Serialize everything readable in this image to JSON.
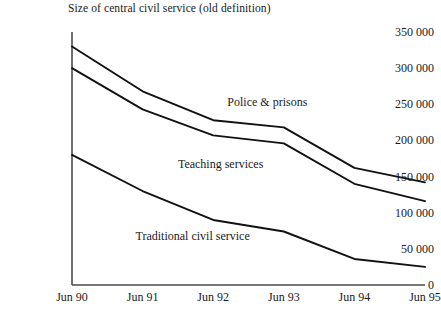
{
  "chart_data": {
    "type": "line",
    "title": "Size of central civil service (old definition)",
    "xlabel": "",
    "ylabel": "",
    "x": [
      "Jun 90",
      "Jun 91",
      "Jun 92",
      "Jun 93",
      "Jun 94",
      "Jun 95"
    ],
    "categories": [
      "Jun 90",
      "Jun 91",
      "Jun 92",
      "Jun 93",
      "Jun 94",
      "Jun 95"
    ],
    "ylim": [
      0,
      350000
    ],
    "xlim_px": [
      72,
      425
    ],
    "yticks": [
      0,
      50000,
      100000,
      150000,
      200000,
      250000,
      300000,
      350000
    ],
    "ytick_labels": [
      "0",
      "50 000",
      "100 000",
      "150 000",
      "200 000",
      "250 000",
      "300 000",
      "350 000"
    ],
    "grid": false,
    "legend": "inline-annotations",
    "series": [
      {
        "name": "Police & prisons",
        "values": [
          330000,
          268000,
          228000,
          218000,
          162000,
          142000
        ],
        "label_x_pct": 0.44,
        "label_y_value": 253000
      },
      {
        "name": "Teaching services",
        "values": [
          300000,
          243000,
          207000,
          196000,
          140000,
          116000
        ],
        "label_x_pct": 0.3,
        "label_y_value": 168000
      },
      {
        "name": "Traditional civil service",
        "values": [
          180000,
          130000,
          90000,
          74000,
          36000,
          25000
        ],
        "label_x_pct": 0.18,
        "label_y_value": 68000
      }
    ]
  },
  "axis": {
    "y_axis_name": "value-axis",
    "x_axis_name": "time-axis"
  }
}
